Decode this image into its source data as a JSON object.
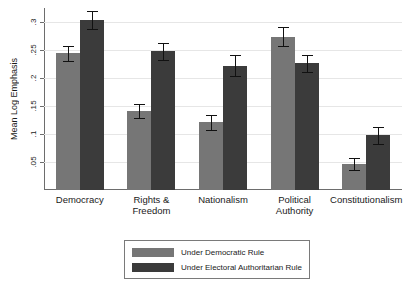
{
  "chart_data": {
    "type": "bar",
    "title": "",
    "xlabel": "",
    "ylabel": "Mean Log Emphasis",
    "ylim": [
      0,
      0.325
    ],
    "grid": true,
    "legend_position": "bottom-center",
    "yticks": [
      0.05,
      0.1,
      0.15,
      0.2,
      0.25,
      0.3
    ],
    "ytick_labels": [
      ".05",
      ".1",
      ".15",
      ".2",
      ".25",
      ".3"
    ],
    "categories": [
      "Democracy",
      "Rights &\nFreedom",
      "Nationalism",
      "Political\nAuthority",
      "Constitutionalism"
    ],
    "series": [
      {
        "name": "Under Democratic Rule",
        "color": "#767676",
        "values": [
          0.244,
          0.141,
          0.121,
          0.274,
          0.047
        ],
        "errors": [
          0.014,
          0.013,
          0.013,
          0.017,
          0.011
        ]
      },
      {
        "name": "Under Electoral Authoritarian Rule",
        "color": "#3b3b3b",
        "values": [
          0.303,
          0.248,
          0.222,
          0.226,
          0.098
        ],
        "errors": [
          0.016,
          0.015,
          0.019,
          0.015,
          0.015
        ]
      }
    ]
  },
  "legend": {
    "entries": [
      {
        "label": "Under Democratic Rule",
        "swatch": "light"
      },
      {
        "label": "Under Electoral Authoritarian Rule",
        "swatch": "dark"
      }
    ]
  }
}
